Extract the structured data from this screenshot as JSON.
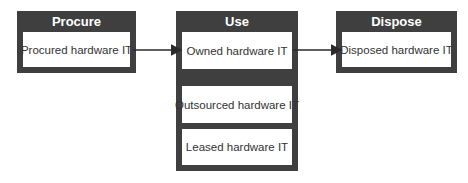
{
  "diagram": {
    "stages": [
      {
        "title": "Procure",
        "items": [
          "Procured hardware IT"
        ]
      },
      {
        "title": "Use",
        "items": [
          "Owned hardware IT",
          "Outsourced hardware IT",
          "Leased hardware IT"
        ]
      },
      {
        "title": "Dispose",
        "items": [
          "Disposed hardware IT"
        ]
      }
    ],
    "arrows": [
      {
        "from": "Procured hardware IT",
        "to": "Owned hardware IT"
      },
      {
        "from": "Owned hardware IT",
        "to": "Disposed hardware IT"
      }
    ],
    "colors": {
      "header": "#3f3f3f",
      "item_bg": "#ffffff",
      "text": "#333333",
      "arrow": "#2a2a2a"
    }
  }
}
